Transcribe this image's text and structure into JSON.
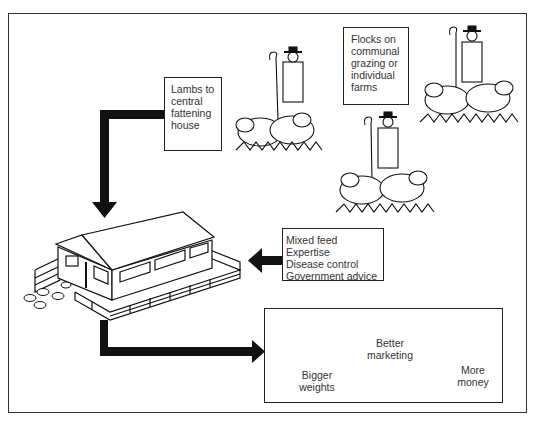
{
  "diagram": {
    "boxes": {
      "lambs": {
        "lines": [
          "Lambs to",
          "central",
          "fattening",
          "house"
        ]
      },
      "flocks": {
        "lines": [
          "Flocks on",
          "communal",
          "grazing or",
          "individual",
          "farms"
        ]
      },
      "inputs": {
        "lines": [
          "Mixed feed",
          "Expertise",
          "Disease control",
          "Government advice"
        ]
      },
      "outputs": {
        "bigger_weights": [
          "Bigger",
          "weights"
        ],
        "better_marketing": [
          "Better",
          "marketing"
        ],
        "more_money": [
          "More",
          "money"
        ]
      }
    },
    "illustrations": [
      "shepherd-with-sheep",
      "shepherd-with-sheep",
      "shepherd-with-sheep",
      "fattening-house",
      "hanging-carcasses",
      "money-bags"
    ],
    "colors": {
      "ink": "#111111",
      "background": "#ffffff"
    }
  }
}
